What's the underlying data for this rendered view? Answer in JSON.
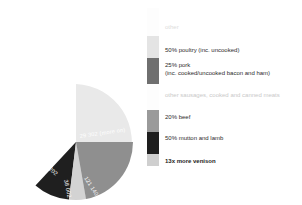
{
  "chart_data": {
    "type": "pie",
    "title": "",
    "subtitle": "",
    "xlabel": "",
    "ylabel": "",
    "legend_position": "right",
    "grid": false,
    "categories": [
      "other",
      "50% poultry (inc. uncooked)",
      "25% pork (inc. cooked/uncooked bacon and ham)",
      "other sausages, cooked and canned meats",
      "20% beef",
      "50% mutton and lamb",
      "13x more venison"
    ],
    "slices": [
      {
        "label": "29 302 (more on)",
        "value": 62,
        "color": "#e9e9e9",
        "label_fill": "#ffffff"
      },
      {
        "label": "121 140",
        "value": 13,
        "color": "#8f8f8f",
        "label_fill": "#ffffff"
      },
      {
        "label": "38 002",
        "value": 7,
        "color": "#d3d3d3",
        "label_fill": "#ffffff"
      },
      {
        "label": "30 202",
        "value": 10,
        "color": "#1f1f1f",
        "label_fill": "#ffffff"
      },
      {
        "label": "20 000",
        "value": 8,
        "color": "#9c9c9c",
        "label_fill": "#ffffff"
      }
    ]
  },
  "legend": {
    "bar_segments": [
      {
        "name": "other",
        "color": "#fdfdfd",
        "height": 28
      },
      {
        "name": "poultry",
        "color": "#e4e4e4",
        "height": 22
      },
      {
        "name": "pork",
        "color": "#6f6f6f",
        "height": 26
      },
      {
        "name": "other-sausages",
        "color": "#fdfdfd",
        "height": 26
      },
      {
        "name": "beef",
        "color": "#9a9a9a",
        "height": 22
      },
      {
        "name": "mutton-and-lamb",
        "color": "#1e1e1e",
        "height": 22
      },
      {
        "name": "venison",
        "color": "#cfcfcf",
        "height": 12
      }
    ],
    "items": [
      {
        "line1": "other",
        "line2": "",
        "style": "ghost",
        "top": 16
      },
      {
        "line1": "50% poultry (inc. uncooked)",
        "line2": "",
        "style": "normal",
        "top": 39
      },
      {
        "line1": "25% pork",
        "line2": "(inc. cooked/uncooked bacon and ham)",
        "style": "normal",
        "top": 54
      },
      {
        "line1": "other sausages, cooked and canned meats",
        "line2": "",
        "style": "faint",
        "top": 84
      },
      {
        "line1": "20% beef",
        "line2": "",
        "style": "normal",
        "top": 106
      },
      {
        "line1": "50% mutton and lamb",
        "line2": "",
        "style": "normal",
        "top": 127
      },
      {
        "line1": "13x more venison",
        "line2": "",
        "style": "strong",
        "top": 150
      }
    ]
  }
}
